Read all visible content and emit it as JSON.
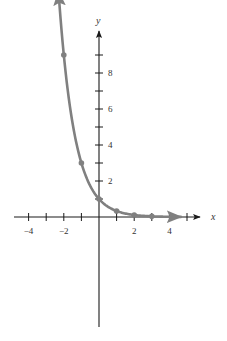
{
  "chart_data": {
    "type": "line",
    "title": "",
    "function": "y = 3^(-x)",
    "xlabel": "x",
    "ylabel": "y",
    "xlim": [
      -5,
      5.7
    ],
    "ylim": [
      -6,
      10.4
    ],
    "x_ticks": [
      -4,
      -3,
      -2,
      -1,
      1,
      2,
      3,
      4,
      5
    ],
    "x_tick_labels": [
      "−4",
      "−2",
      "2",
      "4"
    ],
    "x_tick_label_values": [
      -4,
      -2,
      2,
      4
    ],
    "y_ticks": [
      1,
      2,
      3,
      4,
      5,
      6,
      7,
      8,
      9
    ],
    "y_tick_labels": [
      "2",
      "4",
      "6",
      "8"
    ],
    "y_tick_label_values": [
      2,
      4,
      6,
      8
    ],
    "grid": false,
    "series": [
      {
        "name": "y = 3^(-x)",
        "color": "#808080",
        "points": [
          {
            "x": -2,
            "y": 9
          },
          {
            "x": -1,
            "y": 3
          },
          {
            "x": 0,
            "y": 1
          },
          {
            "x": 1,
            "y": 0.333
          },
          {
            "x": 2,
            "y": 0.111
          },
          {
            "x": 3,
            "y": 0.037
          }
        ]
      }
    ]
  },
  "colors": {
    "axis": "#1a1a1a",
    "curve": "#808080",
    "background": "#ffffff"
  }
}
